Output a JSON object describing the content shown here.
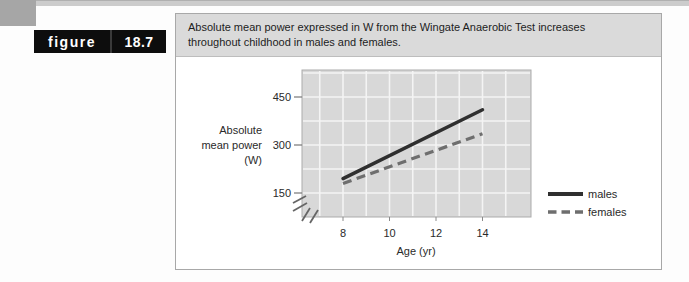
{
  "figure_label": {
    "word": "figure",
    "number": "18.7"
  },
  "caption": {
    "line1": "Absolute mean power expressed in W from the Wingate Anaerobic Test increases",
    "line2": "throughout childhood in males and females."
  },
  "chart_data": {
    "type": "line",
    "title": "",
    "xlabel": "Age (yr)",
    "ylabel": "Absolute mean power (W)",
    "ylabel_lines": [
      "Absolute",
      "mean power",
      "(W)"
    ],
    "x_ticks": [
      8,
      10,
      12,
      14
    ],
    "y_ticks": [
      450,
      300,
      150
    ],
    "x_gridline_ages": [
      7,
      8,
      9,
      10,
      11,
      12,
      13,
      14,
      15
    ],
    "y_gridline_values": [
      525,
      450,
      375,
      300,
      225,
      150
    ],
    "grid": true,
    "axis_break": true,
    "xlim": [
      6.2,
      16
    ],
    "ylim_displayed": [
      150,
      525
    ],
    "x": [
      8,
      14
    ],
    "series": [
      {
        "name": "males",
        "line_style": "solid",
        "color": "#2f2f2f",
        "values": [
          195,
          410
        ]
      },
      {
        "name": "females",
        "line_style": "dashed",
        "color": "#6e6e6e",
        "values": [
          180,
          335
        ]
      }
    ],
    "legend_position": "right"
  },
  "colors": {
    "top_rule": "#cccccc",
    "tab_gray": "#a6a6a6",
    "tab_black": "#0d0d0d",
    "tab_text": "#ffffff",
    "panel_border": "#a8a8a8",
    "caption_bg": "#dadada",
    "caption_text": "#1d1d1d",
    "plot_bg": "#d8d8d8",
    "plot_border": "#ababab",
    "gridline": "#f4f4f4",
    "axis_text": "#2a2a2a",
    "tick_mark": "#777777"
  }
}
